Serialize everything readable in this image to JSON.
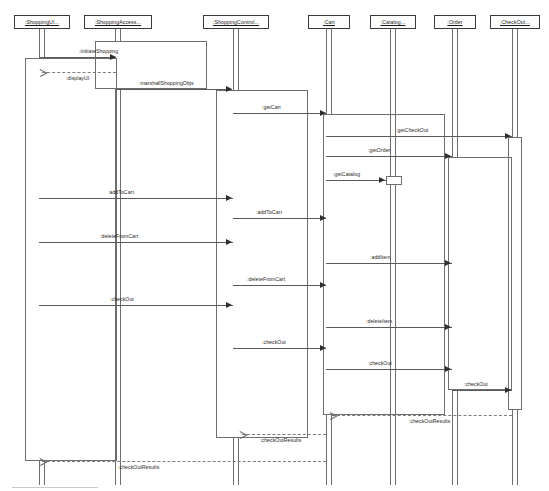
{
  "diagram": {
    "type": "uml-sequence-diagram",
    "background": "#ffffff",
    "line_color": "#5a5a5a",
    "return_line_color": "#7d7d7d",
    "text_color": "#1f1f1f"
  },
  "lifelines": [
    {
      "id": "ui",
      "label": ":ShoppingUI...",
      "x": 14,
      "head_w": 56,
      "center": 42
    },
    {
      "id": "access",
      "label": ":ShoppingAccess...",
      "x": 84,
      "head_w": 68,
      "center": 118
    },
    {
      "id": "control",
      "label": ":ShoppingControl...",
      "x": 203,
      "head_w": 66,
      "center": 236
    },
    {
      "id": "cart",
      "label": ":Cart",
      "x": 308,
      "head_w": 42,
      "center": 329
    },
    {
      "id": "catalog",
      "label": ":Catalog...",
      "x": 370,
      "head_w": 46,
      "center": 393
    },
    {
      "id": "order",
      "label": ":Order",
      "x": 434,
      "head_w": 42,
      "center": 455
    },
    {
      "id": "checkout",
      "label": ":CheckOut...",
      "x": 490,
      "head_w": 50,
      "center": 515
    }
  ],
  "messages": [
    {
      "n": 1,
      "label": ":initiateShopping",
      "from": "ui",
      "to": "access",
      "y": 57,
      "kind": "call"
    },
    {
      "n": 2,
      "label": ":displayUI",
      "from": "access",
      "to": "ui",
      "y": 72,
      "kind": "return"
    },
    {
      "n": 3,
      "label": ":marshallShoppingObjs",
      "from": "access",
      "to": "control",
      "y": 89,
      "kind": "call"
    },
    {
      "n": 4,
      "label": ":getCart",
      "from": "control",
      "to": "cart",
      "y": 113,
      "kind": "call"
    },
    {
      "n": 5,
      "label": ":getCheckOut",
      "from": "cart",
      "to": "checkout",
      "y": 136,
      "kind": "call"
    },
    {
      "n": 6,
      "label": ":getOrder",
      "from": "cart",
      "to": "order",
      "y": 156,
      "kind": "call"
    },
    {
      "n": 7,
      "label": ":getCatalog",
      "from": "cart",
      "to": "catalog",
      "y": 180,
      "kind": "call"
    },
    {
      "n": 8,
      "label": ":addToCart",
      "from": "ui",
      "to": "control",
      "y": 198,
      "kind": "call"
    },
    {
      "n": 9,
      "label": ":addToCart",
      "from": "control",
      "to": "cart",
      "y": 218,
      "kind": "call"
    },
    {
      "n": 10,
      "label": ":deleteFromCart",
      "from": "ui",
      "to": "control",
      "y": 242,
      "kind": "call"
    },
    {
      "n": 11,
      "label": ":addItem",
      "from": "cart",
      "to": "order",
      "y": 263,
      "kind": "call"
    },
    {
      "n": 12,
      "label": ":deleteFromCart",
      "from": "control",
      "to": "cart",
      "y": 285,
      "kind": "call"
    },
    {
      "n": 13,
      "label": ":checkOut",
      "from": "ui",
      "to": "control",
      "y": 305,
      "kind": "call"
    },
    {
      "n": 14,
      "label": ":deleteItem",
      "from": "cart",
      "to": "order",
      "y": 327,
      "kind": "call"
    },
    {
      "n": 15,
      "label": ":checkOut",
      "from": "control",
      "to": "cart",
      "y": 348,
      "kind": "call"
    },
    {
      "n": 16,
      "label": ":checkOut",
      "from": "cart",
      "to": "order",
      "y": 369,
      "kind": "call"
    },
    {
      "n": 17,
      "label": ":checkOut",
      "from": "order",
      "to": "checkout",
      "y": 390,
      "kind": "call"
    },
    {
      "n": 18,
      "label": ":checkOutResults",
      "from": "order",
      "to": "cart",
      "y": 415,
      "kind": "return"
    },
    {
      "n": 19,
      "label": ":checkOutResults",
      "from": "control",
      "to": "ui",
      "y": 434,
      "kind": "return"
    },
    {
      "n": 20,
      "label": ":checkOutResults",
      "from": "cart",
      "to": "ui",
      "y": 461,
      "kind": "return"
    }
  ],
  "activations": [
    {
      "owner": "ui",
      "x": 25,
      "y": 58,
      "w": 92,
      "h": 403,
      "style": "wide"
    },
    {
      "owner": "access",
      "x": 95,
      "y": 41,
      "w": 112,
      "h": 48,
      "style": "wide"
    },
    {
      "owner": "control",
      "x": 216,
      "y": 90,
      "w": 92,
      "h": 348,
      "style": "wide"
    },
    {
      "owner": "cart",
      "x": 323,
      "y": 114,
      "w": 122,
      "h": 301,
      "style": "wide"
    },
    {
      "owner": "catalog",
      "x": 386,
      "y": 176,
      "w": 16,
      "h": 9,
      "style": "small"
    },
    {
      "owner": "order",
      "x": 448,
      "y": 157,
      "w": 64,
      "h": 233,
      "style": "wide"
    },
    {
      "owner": "checkout",
      "x": 508,
      "y": 137,
      "w": 14,
      "h": 273,
      "style": "wide"
    }
  ]
}
